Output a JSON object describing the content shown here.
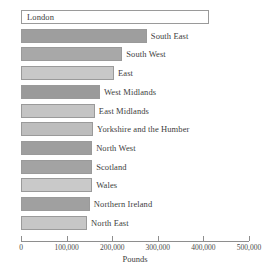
{
  "chart_data": {
    "type": "bar",
    "orientation": "horizontal",
    "title": "",
    "xlabel": "Pounds",
    "ylabel": "",
    "xlim": [
      0,
      500000
    ],
    "xticks": [
      0,
      100000,
      200000,
      300000,
      400000,
      500000
    ],
    "xtick_labels": [
      "0",
      "100,000",
      "200,000",
      "300,000",
      "400,000",
      "500,000"
    ],
    "grid": false,
    "legend": "none",
    "categories": [
      "London",
      "South East",
      "South West",
      "East",
      "West Midlands",
      "East Midlands",
      "Yorkshire and the Humber",
      "North West",
      "Scotland",
      "Wales",
      "Northern Ireland",
      "North East"
    ],
    "values": [
      412000,
      276000,
      222000,
      204000,
      173000,
      162000,
      158000,
      156000,
      156000,
      156000,
      151000,
      145000
    ],
    "bar_fills": [
      "#ffffff",
      "#9e9e9e",
      "#a8a8a8",
      "#c8c8c8",
      "#9a9a9a",
      "#c4c4c4",
      "#bdbdbd",
      "#9e9e9e",
      "#a3a3a3",
      "#c9c9c9",
      "#a0a0a0",
      "#c6c6c6"
    ],
    "bar_border": "#9a9a9a",
    "label_placement": [
      "inside",
      "outside",
      "outside",
      "outside",
      "outside",
      "outside",
      "outside",
      "outside",
      "outside",
      "outside",
      "outside",
      "outside"
    ]
  }
}
